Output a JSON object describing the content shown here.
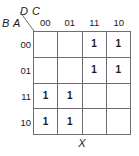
{
  "figure": {
    "type": "karnaugh-map",
    "output_label": "X",
    "column_variables": "D C",
    "row_variables": "B A",
    "column_headers": [
      "00",
      "01",
      "11",
      "10"
    ],
    "row_headers": [
      "00",
      "01",
      "11",
      "10"
    ],
    "cells": [
      [
        "",
        "",
        "1",
        "1"
      ],
      [
        "",
        "",
        "1",
        "1"
      ],
      [
        "1",
        "1",
        "",
        ""
      ],
      [
        "1",
        "1",
        "",
        ""
      ]
    ],
    "colors": {
      "grid_line": "#6e6e72",
      "text": "#1a1a1a",
      "background": "#ffffff"
    }
  }
}
